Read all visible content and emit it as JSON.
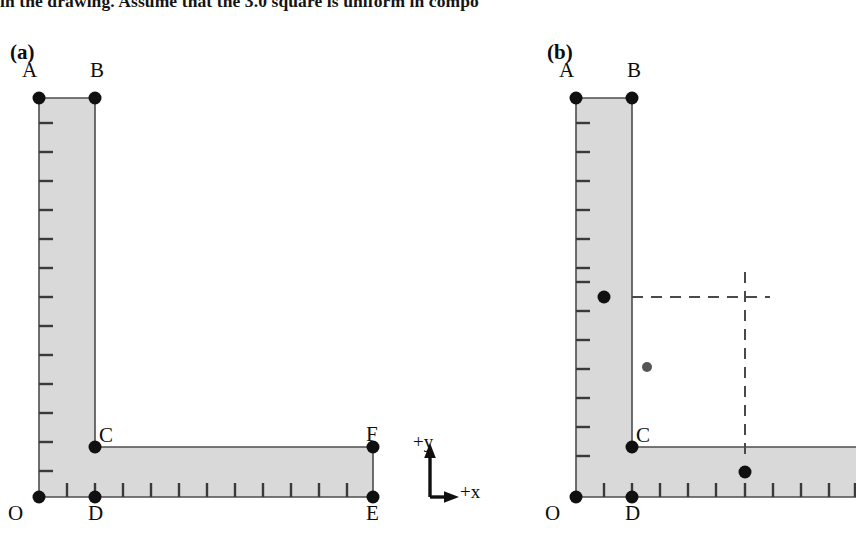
{
  "figure": {
    "top_caption": "in the drawing. Assume that the 3.0 square is uniform in compo",
    "background_color": "#ffffff",
    "plate_fill_color": "#d9d9d9",
    "plate_edge_color": "#4d4d4d",
    "marker_color": "#101010",
    "dashed_color": "#4a4a4a"
  },
  "panels": [
    {
      "id": "a",
      "label": "(a)",
      "vertices": [
        {
          "name": "A",
          "label": "A",
          "x": 39,
          "y": 98
        },
        {
          "name": "B",
          "label": "B",
          "x": 95,
          "y": 98
        },
        {
          "name": "C",
          "label": "C",
          "x": 95,
          "y": 447
        },
        {
          "name": "D",
          "label": "D",
          "x": 95,
          "y": 497
        },
        {
          "name": "E",
          "label": "E",
          "x": 373,
          "y": 497
        },
        {
          "name": "F",
          "label": "F",
          "x": 373,
          "y": 447
        },
        {
          "name": "O",
          "label": "O",
          "x": 39,
          "y": 497
        }
      ],
      "vertical_ruler_ticks": 13,
      "horizontal_ruler_ticks": 11,
      "center_of_mass_dots": []
    },
    {
      "id": "b",
      "label": "(b)",
      "vertices": [
        {
          "name": "A",
          "label": "A",
          "x": 576,
          "y": 98
        },
        {
          "name": "B",
          "label": "B",
          "x": 632,
          "y": 98
        },
        {
          "name": "C",
          "label": "C",
          "x": 632,
          "y": 447
        },
        {
          "name": "D",
          "label": "D",
          "x": 632,
          "y": 497
        },
        {
          "name": "O",
          "label": "O",
          "x": 576,
          "y": 497
        }
      ],
      "vertical_ruler_ticks": 13,
      "horizontal_ruler_ticks": 10,
      "center_of_mass_dots": [
        {
          "name": "vertical-arm-com",
          "x": 604,
          "y": 297,
          "r": 6.5,
          "color": "#101010"
        },
        {
          "name": "combined-com",
          "x": 647,
          "y": 367,
          "r": 5.0,
          "color": "#555555"
        },
        {
          "name": "horizontal-arm-com",
          "x": 745,
          "y": 472,
          "r": 6.5,
          "color": "#101010"
        }
      ],
      "dashed_guides": {
        "horizontal_y": 297,
        "horizontal_x_start": 632,
        "horizontal_x_end": 770,
        "vertical_x": 745,
        "vertical_y_start": 272,
        "vertical_y_end": 455
      }
    }
  ],
  "axis_indicator": {
    "name": "coordinate-axes",
    "y_label": "+y",
    "x_label": "+x",
    "origin_x": 430,
    "origin_y": 497
  }
}
